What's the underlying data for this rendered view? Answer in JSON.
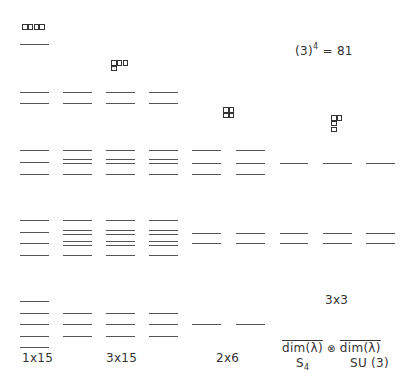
{
  "title": "(3)^4 = 81",
  "title_parts": {
    "base": "(3)",
    "exp": "4",
    "rest": " = 81"
  },
  "columns": [
    {
      "id": "c1",
      "x": 20,
      "w": 29
    },
    {
      "id": "c2",
      "x": 63,
      "w": 29
    },
    {
      "id": "c3",
      "x": 106,
      "w": 29
    },
    {
      "id": "c4",
      "x": 149,
      "w": 29
    },
    {
      "id": "c5",
      "x": 192,
      "w": 29
    },
    {
      "id": "c6",
      "x": 236,
      "w": 29
    },
    {
      "id": "c7",
      "x": 280,
      "w": 28
    },
    {
      "id": "c8",
      "x": 323,
      "w": 29
    },
    {
      "id": "c9",
      "x": 366,
      "w": 29
    }
  ],
  "levels": [
    {
      "col": 0,
      "ys": [
        44
      ]
    },
    {
      "col": 0,
      "ys": [
        92,
        103
      ]
    },
    {
      "col": 1,
      "ys": [
        92,
        103
      ]
    },
    {
      "col": 2,
      "ys": [
        92,
        103
      ]
    },
    {
      "col": 3,
      "ys": [
        92,
        103
      ]
    },
    {
      "col": 0,
      "ys": [
        150,
        162,
        174
      ]
    },
    {
      "col": 1,
      "ys": [
        150,
        159,
        163,
        174
      ]
    },
    {
      "col": 2,
      "ys": [
        150,
        159,
        163,
        174
      ]
    },
    {
      "col": 3,
      "ys": [
        150,
        159,
        163,
        174
      ]
    },
    {
      "col": 4,
      "ys": [
        150,
        163,
        174
      ]
    },
    {
      "col": 5,
      "ys": [
        150,
        163,
        174
      ]
    },
    {
      "col": 6,
      "ys": [
        163
      ]
    },
    {
      "col": 7,
      "ys": [
        163
      ]
    },
    {
      "col": 8,
      "ys": [
        163
      ]
    },
    {
      "col": 0,
      "ys": [
        220,
        232,
        243,
        255
      ]
    },
    {
      "col": 1,
      "ys": [
        220,
        230,
        234,
        241,
        245,
        255
      ]
    },
    {
      "col": 2,
      "ys": [
        220,
        230,
        234,
        241,
        245,
        255
      ]
    },
    {
      "col": 3,
      "ys": [
        220,
        230,
        234,
        241,
        245,
        255
      ]
    },
    {
      "col": 4,
      "ys": [
        233,
        243
      ]
    },
    {
      "col": 5,
      "ys": [
        233,
        243
      ]
    },
    {
      "col": 6,
      "ys": [
        233,
        243
      ]
    },
    {
      "col": 7,
      "ys": [
        233,
        243
      ]
    },
    {
      "col": 8,
      "ys": [
        233,
        243
      ]
    },
    {
      "col": 0,
      "ys": [
        301,
        313,
        324,
        336,
        347
      ]
    },
    {
      "col": 1,
      "ys": [
        313,
        324,
        336
      ]
    },
    {
      "col": 2,
      "ys": [
        313,
        324,
        336
      ]
    },
    {
      "col": 3,
      "ys": [
        313,
        324,
        336
      ]
    },
    {
      "col": 4,
      "ys": [
        324
      ]
    },
    {
      "col": 5,
      "ys": [
        324
      ]
    }
  ],
  "young_diagrams": [
    {
      "name": "young-diagram-4",
      "x": 22,
      "y": 24,
      "boxes": [
        [
          0,
          0
        ],
        [
          1,
          0
        ],
        [
          2,
          0
        ],
        [
          3,
          0
        ]
      ]
    },
    {
      "name": "young-diagram-3-1",
      "x": 111,
      "y": 60,
      "boxes": [
        [
          0,
          0
        ],
        [
          1,
          0
        ],
        [
          2,
          0
        ],
        [
          0,
          1
        ]
      ]
    },
    {
      "name": "young-diagram-2-2",
      "x": 223,
      "y": 107,
      "boxes": [
        [
          0,
          0
        ],
        [
          1,
          0
        ],
        [
          0,
          1
        ],
        [
          1,
          1
        ]
      ]
    },
    {
      "name": "young-diagram-2-1-1",
      "x": 331,
      "y": 115,
      "boxes": [
        [
          0,
          0
        ],
        [
          1,
          0
        ],
        [
          0,
          1
        ],
        [
          0,
          2
        ]
      ]
    }
  ],
  "labels": {
    "mult_1x15": "1x15",
    "mult_3x15": "3x15",
    "mult_2x6": "2x6",
    "mult_3x3": "3x3",
    "dim_left": "dim(λ)",
    "otimes": "⊗",
    "dim_right": "dim(λ)",
    "group_s": "S",
    "group_s_sub": "4",
    "group_su": "SU (3)"
  }
}
